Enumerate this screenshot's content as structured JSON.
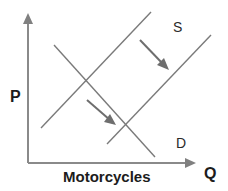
{
  "diagram": {
    "type": "supply-demand",
    "title": "Motorcycles",
    "axes": {
      "y_label": "P",
      "x_label": "Q",
      "origin": [
        28,
        163
      ],
      "y_axis_top": [
        28,
        14
      ],
      "x_axis_right": [
        195,
        163
      ]
    },
    "curves": [
      {
        "id": "supply-1",
        "label": "S",
        "from": [
          41,
          128
        ],
        "to": [
          151,
          12
        ]
      },
      {
        "id": "supply-2",
        "label": "",
        "from": [
          107,
          144
        ],
        "to": [
          211,
          35
        ]
      },
      {
        "id": "demand",
        "label": "D",
        "from": [
          54,
          45
        ],
        "to": [
          155,
          157
        ]
      }
    ],
    "labels": {
      "supply": "S",
      "demand": "D",
      "price": "P",
      "quantity": "Q",
      "good": "Motorcycles"
    },
    "shift_arrows": [
      {
        "id": "supply-shift-arrow",
        "from": [
          140,
          40
        ],
        "to": [
          168,
          69
        ],
        "meaning": "supply increases (shift right)"
      },
      {
        "id": "equilibrium-shift-arrow",
        "from": [
          87,
          100
        ],
        "to": [
          115,
          124
        ],
        "meaning": "equilibrium moves down along demand"
      }
    ],
    "colors": {
      "axis": "#8a8a8a",
      "curve": "#7a7a7a",
      "arrow": "#6e6e6e",
      "text": "#1c1c1c"
    }
  }
}
